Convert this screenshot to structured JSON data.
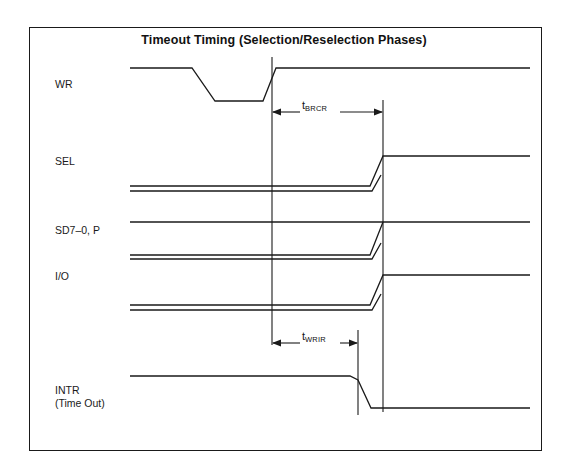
{
  "figure": {
    "title": "Timeout Timing (Selection/Reselection Phases)",
    "background_color": "#ffffff",
    "line_color": "#1a1a1a",
    "frame": {
      "x": 29,
      "y": 27,
      "width": 513,
      "height": 424
    }
  },
  "signals": [
    {
      "name": "WR",
      "label": "WR",
      "label_x": 55,
      "label_y": 84,
      "high_y": 68,
      "low_y": 101,
      "type": "single-strobe-low"
    },
    {
      "name": "SEL",
      "label": "SEL",
      "label_x": 55,
      "label_y": 160,
      "high_y": 156,
      "low_y": 186,
      "low_y2": 191,
      "transition_x": 383,
      "type": "double-low-rising"
    },
    {
      "name": "SD7-0, P",
      "label": "SD7–0, P",
      "label_x": 55,
      "label_y": 228,
      "high_y": 222,
      "low_y": 255,
      "low_y2": 259,
      "transition_x": 383,
      "type": "double-low-rising-with-high"
    },
    {
      "name": "I/O",
      "label": "I/O",
      "label_x": 55,
      "label_y": 273,
      "high_y": 275,
      "low_y": 305,
      "low_y2": 310,
      "transition_x": 383,
      "type": "double-low-rising"
    },
    {
      "name": "INTR (Time Out)",
      "label_line1": "INTR",
      "label_line2": "(Time Out)",
      "label_x": 55,
      "label_y": 388,
      "high_y": 376,
      "low_y": 408,
      "transition_x": 358,
      "type": "falling"
    }
  ],
  "timing_markers": [
    {
      "name": "tBRCR",
      "symbol": "t",
      "subscript": "BRCR",
      "label_x": 305,
      "label_y": 105,
      "arrow_y": 112,
      "start_x": 272,
      "end_x": 383
    },
    {
      "name": "tWRIR",
      "symbol": "t",
      "subscript": "WRIR",
      "label_x": 305,
      "label_y": 336,
      "arrow_y": 343,
      "start_x": 272,
      "end_x": 358
    }
  ],
  "reference_lines": [
    {
      "name": "left-edge-reference",
      "x": 272,
      "y_top": 57,
      "y_bottom": 345
    },
    {
      "name": "right-edge-reference",
      "x": 383,
      "y_top": 100,
      "y_bottom": 412
    },
    {
      "name": "intr-fall-reference",
      "x": 358,
      "y_top": 330,
      "y_bottom": 415
    }
  ],
  "waveform_extents": {
    "left_x": 130,
    "right_x": 530
  }
}
